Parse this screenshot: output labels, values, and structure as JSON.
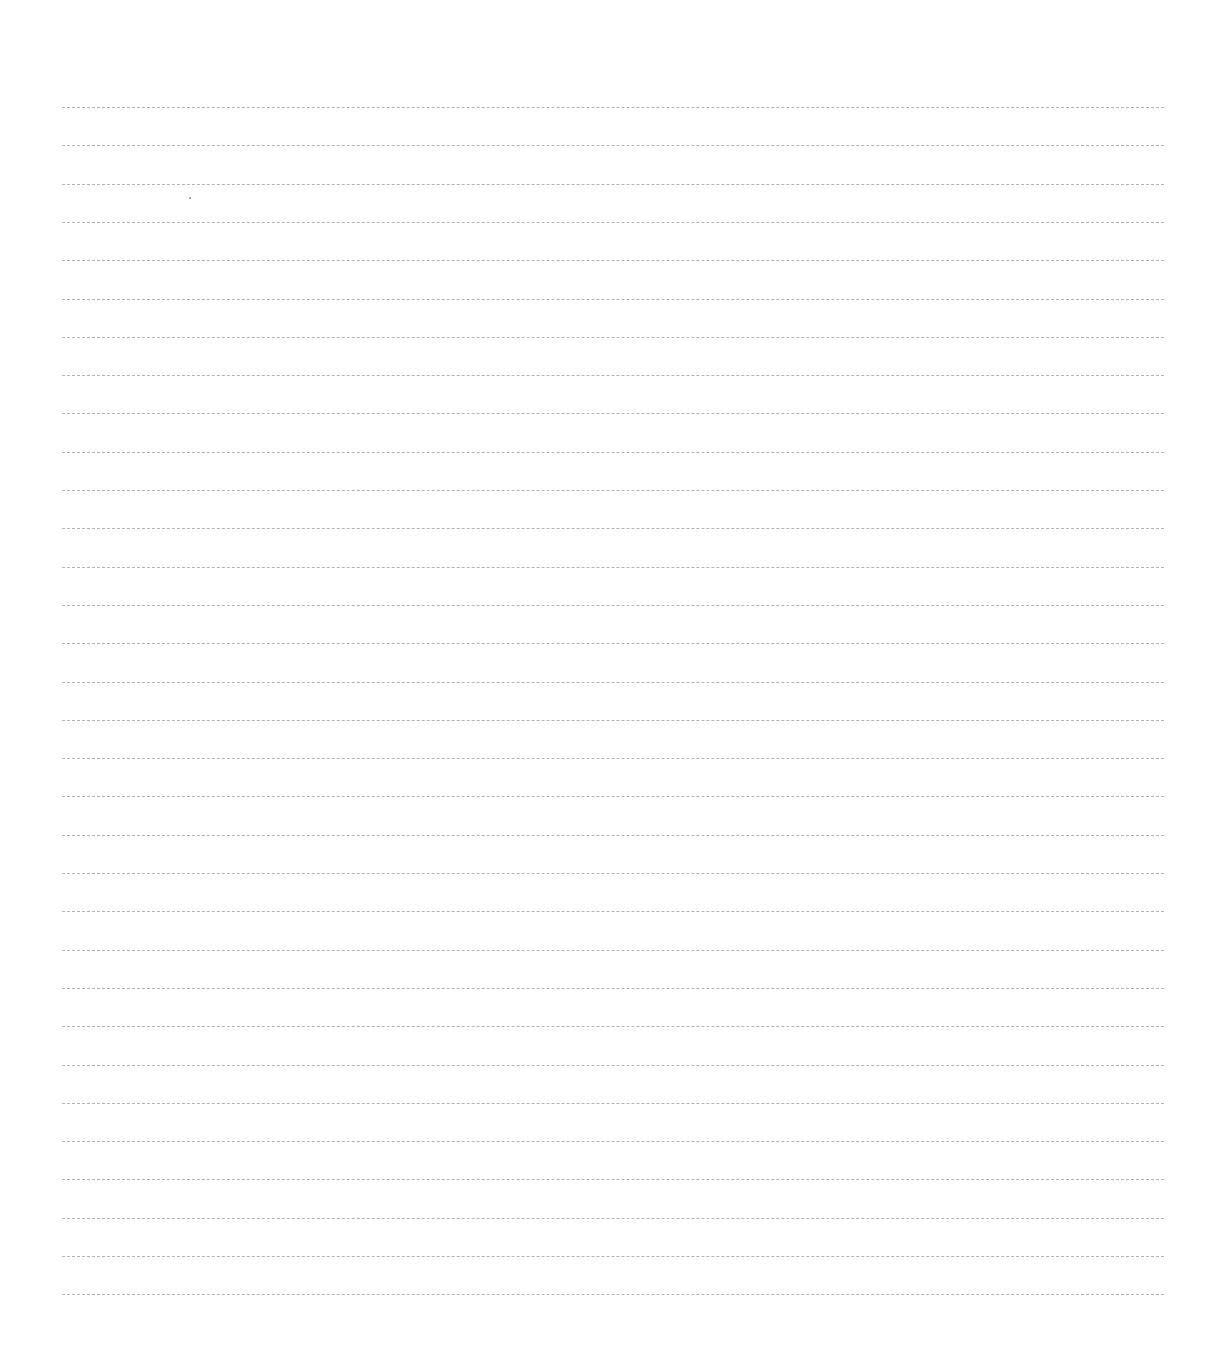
{
  "page": {
    "type": "lined-paper",
    "background": "#ffffff",
    "line_color": "#9a9a9a",
    "line_count": 32,
    "first_line_y": 107,
    "line_spacing": 38.3,
    "line_left": 62,
    "line_right": 1164
  }
}
